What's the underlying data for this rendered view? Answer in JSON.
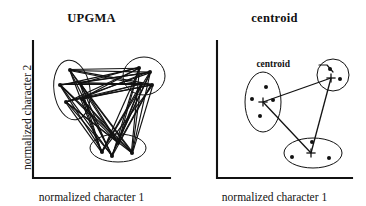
{
  "figure": {
    "width": 366,
    "height": 206,
    "background": "#ffffff",
    "ink_color": "#111111"
  },
  "panels": [
    {
      "id": "upgma",
      "title": "UPGMA",
      "xlabel": "normalized character 1",
      "ylabel": "normalized character 2",
      "show_ylabel": true,
      "annotation": null,
      "linkage_style": "all-pairs",
      "axes": {
        "x0": 33,
        "y0": 178,
        "x1": 170,
        "y1": 41
      },
      "clusters": [
        {
          "name": "left-cluster",
          "shape": "ellipse",
          "cx": 72,
          "cy": 90,
          "rx": 18,
          "ry": 30,
          "rotation": -8,
          "points": [
            {
              "x": 70,
              "y": 70
            },
            {
              "x": 60,
              "y": 85
            },
            {
              "x": 80,
              "y": 83
            },
            {
              "x": 66,
              "y": 102
            },
            {
              "x": 82,
              "y": 99
            }
          ],
          "centroid": null
        },
        {
          "name": "top-right-cluster",
          "shape": "ellipse",
          "cx": 144,
          "cy": 76,
          "rx": 21,
          "ry": 19,
          "rotation": 0,
          "points": [
            {
              "x": 139,
              "y": 68
            },
            {
              "x": 150,
              "y": 72
            },
            {
              "x": 141,
              "y": 84
            },
            {
              "x": 152,
              "y": 85
            }
          ],
          "centroid": null
        },
        {
          "name": "bottom-cluster",
          "shape": "ellipse",
          "cx": 118,
          "cy": 148,
          "rx": 28,
          "ry": 14,
          "rotation": 0,
          "points": [
            {
              "x": 102,
              "y": 152
            },
            {
              "x": 118,
              "y": 143
            },
            {
              "x": 132,
              "y": 153
            },
            {
              "x": 112,
              "y": 156
            }
          ],
          "centroid": null
        }
      ]
    },
    {
      "id": "centroid",
      "title": "centroid",
      "xlabel": "normalized character 1",
      "ylabel": null,
      "show_ylabel": false,
      "annotation": {
        "label": "centroid",
        "label_x": 290,
        "label_y": 67,
        "leader": [
          {
            "x": 319,
            "y": 65
          },
          {
            "x": 327,
            "y": 65
          },
          {
            "x": 333,
            "y": 72
          }
        ]
      },
      "linkage_style": "centroid-to-centroid",
      "axes": {
        "x0": 217,
        "y0": 178,
        "x1": 352,
        "y1": 41
      },
      "clusters": [
        {
          "name": "left-cluster",
          "shape": "ellipse",
          "cx": 263,
          "cy": 102,
          "rx": 18,
          "ry": 30,
          "rotation": 0,
          "points": [
            {
              "x": 266,
              "y": 87
            },
            {
              "x": 252,
              "y": 99
            },
            {
              "x": 273,
              "y": 100
            },
            {
              "x": 260,
              "y": 116
            }
          ],
          "centroid": {
            "x": 263,
            "y": 102
          }
        },
        {
          "name": "top-right-cluster",
          "shape": "circle",
          "cx": 333,
          "cy": 75,
          "rx": 16,
          "ry": 16,
          "rotation": 0,
          "points": [
            {
              "x": 330,
              "y": 69
            },
            {
              "x": 340,
              "y": 79
            }
          ],
          "centroid": {
            "x": 331,
            "y": 78
          }
        },
        {
          "name": "bottom-cluster",
          "shape": "ellipse",
          "cx": 313,
          "cy": 153,
          "rx": 29,
          "ry": 15,
          "rotation": 0,
          "points": [
            {
              "x": 292,
              "y": 157
            },
            {
              "x": 312,
              "y": 142
            },
            {
              "x": 329,
              "y": 158
            }
          ],
          "centroid": {
            "x": 311,
            "y": 153
          }
        }
      ]
    }
  ]
}
